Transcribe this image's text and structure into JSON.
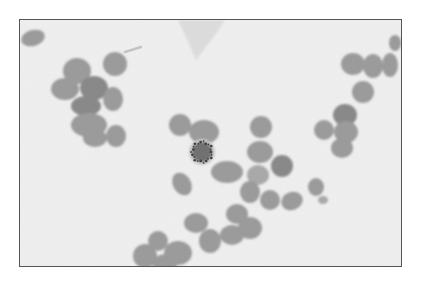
{
  "image": {
    "description": "Grayscale light micrograph of a blood smear showing clusters of red blood cells around a central cell with a dark stippled rim, with a faint debris fragment at the top",
    "colors": {
      "background": "#f0f0f0",
      "cell": "#9a9a9a",
      "cell_dark": "#878787",
      "cell_light": "#a8a8a8",
      "border": "#555555",
      "stipple": "#3a3a3a"
    }
  }
}
